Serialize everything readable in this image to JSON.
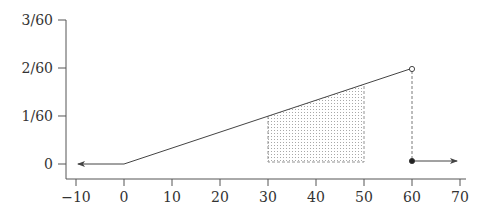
{
  "chart_data": {
    "type": "line",
    "title": "",
    "xlabel": "",
    "ylabel": "",
    "xlim": [
      -12,
      72
    ],
    "ylim": [
      0,
      0.05
    ],
    "x_ticks": [
      -10,
      0,
      10,
      20,
      30,
      40,
      50,
      60,
      70
    ],
    "x_tick_labels": [
      "−10",
      "0",
      "10",
      "20",
      "30",
      "40",
      "50",
      "60",
      "70"
    ],
    "y_ticks": [
      0,
      0.016667,
      0.033333,
      0.05
    ],
    "y_tick_labels": [
      "0",
      "1/60",
      "2/60",
      "3/60"
    ],
    "grid": false,
    "legend": null,
    "series": [
      {
        "name": "density",
        "segments": [
          {
            "x": [
              -10,
              0
            ],
            "y": [
              0,
              0
            ],
            "note": "arrow extending to -infinity"
          },
          {
            "x": [
              0,
              60
            ],
            "y": [
              0,
              0.033333
            ],
            "note": "linear increase f(x)=x/1800"
          },
          {
            "x": [
              60,
              70
            ],
            "y": [
              0,
              0
            ],
            "note": "arrow extending to +infinity"
          }
        ],
        "points": [
          {
            "x": 60,
            "y": 0.033333,
            "style": "open-circle"
          },
          {
            "x": 60,
            "y": 0,
            "style": "filled-circle"
          }
        ]
      }
    ],
    "annotations": [
      {
        "type": "shaded-region",
        "x_from": 30,
        "x_to": 50,
        "fill": "dotted",
        "label": "P(30 ≤ X ≤ 50)"
      },
      {
        "type": "dashed-vertical",
        "x": 60,
        "y_from": 0,
        "y_to": 0.033333
      }
    ]
  },
  "colors": {
    "axis": "#555555",
    "line": "#444444",
    "shade_dots": "#9a9a9a",
    "text": "#333333"
  }
}
